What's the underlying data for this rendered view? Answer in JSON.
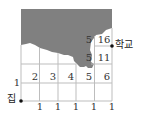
{
  "diagram": {
    "type": "grid-path-counting",
    "grid": {
      "columns": 5,
      "rows": 5
    },
    "start_label": "집",
    "end_label": "학교",
    "bottom_labels": [
      "1",
      "1",
      "1",
      "1",
      "1"
    ],
    "left_labels": [
      "1"
    ],
    "row_2_values": [
      "2",
      "3",
      "4",
      "5",
      "6"
    ],
    "row_3_values": [
      "5",
      "11"
    ],
    "row_4_values": [
      "5",
      "16"
    ],
    "shaded_region_color": "#808080"
  }
}
